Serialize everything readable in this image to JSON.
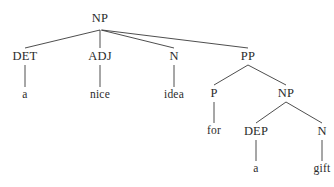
{
  "diagram": {
    "kind": "constituency-syntax-tree",
    "sentence": "a nice idea for a gift",
    "background_color": "#ffffff",
    "text_color": "#2b2b2b",
    "edge_color": "#3a3a3a",
    "nodes": [
      {
        "id": "np-root",
        "label": "NP",
        "type": "category",
        "x": 100,
        "y": 18
      },
      {
        "id": "det",
        "label": "DET",
        "type": "category",
        "x": 25,
        "y": 56
      },
      {
        "id": "adj",
        "label": "ADJ",
        "type": "category",
        "x": 100,
        "y": 56
      },
      {
        "id": "n1",
        "label": "N",
        "type": "category",
        "x": 174,
        "y": 56
      },
      {
        "id": "pp",
        "label": "PP",
        "type": "category",
        "x": 248,
        "y": 56
      },
      {
        "id": "leaf-a1",
        "label": "a",
        "type": "leaf",
        "x": 25,
        "y": 95
      },
      {
        "id": "leaf-nice",
        "label": "nice",
        "type": "leaf",
        "x": 100,
        "y": 95
      },
      {
        "id": "leaf-idea",
        "label": "idea",
        "type": "leaf",
        "x": 174,
        "y": 95
      },
      {
        "id": "p",
        "label": "P",
        "type": "category",
        "x": 214,
        "y": 93
      },
      {
        "id": "np-sub",
        "label": "NP",
        "type": "category",
        "x": 286,
        "y": 93
      },
      {
        "id": "leaf-for",
        "label": "for",
        "type": "leaf",
        "x": 214,
        "y": 131
      },
      {
        "id": "dep",
        "label": "DEP",
        "type": "category",
        "x": 256,
        "y": 131
      },
      {
        "id": "n2",
        "label": "N",
        "type": "category",
        "x": 322,
        "y": 131
      },
      {
        "id": "leaf-a2",
        "label": "a",
        "type": "leaf",
        "x": 256,
        "y": 169
      },
      {
        "id": "leaf-gift",
        "label": "gift",
        "type": "leaf",
        "x": 322,
        "y": 169
      }
    ],
    "edges": [
      {
        "from": "np-root",
        "to": "det",
        "x1": 100,
        "y1": 30,
        "x2": 25,
        "y2": 48
      },
      {
        "from": "np-root",
        "to": "adj",
        "x1": 100,
        "y1": 30,
        "x2": 100,
        "y2": 48
      },
      {
        "from": "np-root",
        "to": "n1",
        "x1": 101,
        "y1": 30,
        "x2": 174,
        "y2": 48
      },
      {
        "from": "np-root",
        "to": "pp",
        "x1": 102,
        "y1": 30,
        "x2": 248,
        "y2": 48
      },
      {
        "from": "det",
        "to": "leaf-a1",
        "x1": 25,
        "y1": 65,
        "x2": 25,
        "y2": 87
      },
      {
        "from": "adj",
        "to": "leaf-nice",
        "x1": 100,
        "y1": 65,
        "x2": 100,
        "y2": 87
      },
      {
        "from": "n1",
        "to": "leaf-idea",
        "x1": 174,
        "y1": 65,
        "x2": 174,
        "y2": 87
      },
      {
        "from": "pp",
        "to": "p",
        "x1": 248,
        "y1": 65,
        "x2": 214,
        "y2": 85
      },
      {
        "from": "pp",
        "to": "np-sub",
        "x1": 248,
        "y1": 65,
        "x2": 286,
        "y2": 85
      },
      {
        "from": "p",
        "to": "leaf-for",
        "x1": 214,
        "y1": 102,
        "x2": 214,
        "y2": 123
      },
      {
        "from": "np-sub",
        "to": "dep",
        "x1": 286,
        "y1": 102,
        "x2": 256,
        "y2": 123
      },
      {
        "from": "np-sub",
        "to": "n2",
        "x1": 286,
        "y1": 102,
        "x2": 322,
        "y2": 123
      },
      {
        "from": "dep",
        "to": "leaf-a2",
        "x1": 256,
        "y1": 140,
        "x2": 256,
        "y2": 161
      },
      {
        "from": "n2",
        "to": "leaf-gift",
        "x1": 322,
        "y1": 140,
        "x2": 322,
        "y2": 161
      }
    ]
  }
}
